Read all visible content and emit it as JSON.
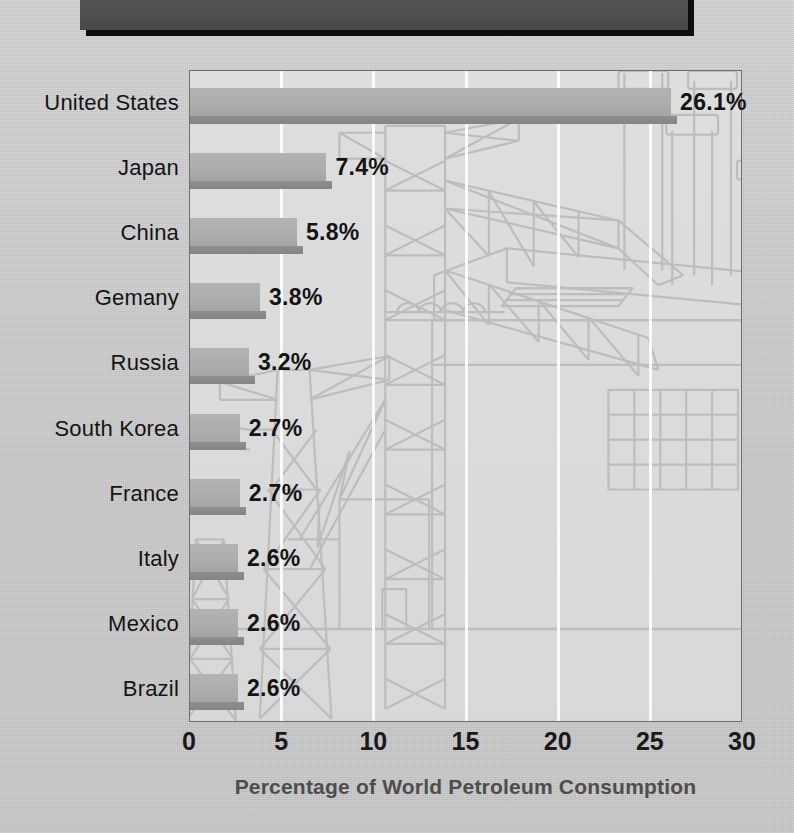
{
  "banner": {
    "label": ""
  },
  "chart_data": {
    "type": "bar",
    "orientation": "horizontal",
    "title": "",
    "xlabel": "Percentage of World Petroleum Consumption",
    "ylabel": "",
    "xlim": [
      0,
      30
    ],
    "xticks": [
      "0",
      "5",
      "10",
      "15",
      "20",
      "25",
      "30"
    ],
    "xtick_values": [
      0,
      5,
      10,
      15,
      20,
      25,
      30
    ],
    "gridlines": [
      5,
      10,
      15,
      20,
      25
    ],
    "grid": true,
    "grid_color": "#fdfdfd",
    "legend": "none",
    "categories": [
      "United States",
      "Japan",
      "China",
      "Gemany",
      "Russia",
      "South Korea",
      "France",
      "Italy",
      "Mexico",
      "Brazil"
    ],
    "values": [
      26.1,
      7.4,
      5.8,
      3.8,
      3.2,
      2.7,
      2.7,
      2.6,
      2.6,
      2.6
    ],
    "data_labels": [
      "26.1%",
      "7.4%",
      "5.8%",
      "3.8%",
      "3.2%",
      "2.7%",
      "2.7%",
      "2.6%",
      "2.6%",
      "2.6%"
    ],
    "bar_color": "#ababab",
    "bar_shadow_color": "#878787",
    "plot_background": "#dadada",
    "page_background": "#cdcdcd",
    "text_color": "#141414",
    "axis_title_color": "#4d4d4d"
  },
  "background_art": {
    "description": "faint line drawing of electrical transmission towers and a power plant with smokestacks",
    "line_color": "#b9b9b9"
  }
}
